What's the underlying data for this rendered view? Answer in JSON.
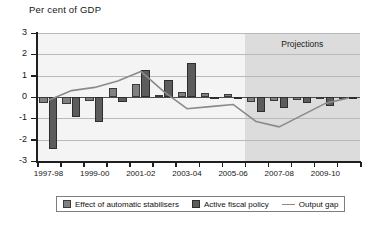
{
  "chart_data": {
    "type": "bar",
    "title": "Per cent of GDP",
    "xlabel": "",
    "ylabel": "",
    "ylim": [
      -3,
      3
    ],
    "yticks": [
      3,
      2,
      1,
      0,
      -1,
      -2,
      -3
    ],
    "grid": true,
    "legend_position": "bottom",
    "categories": [
      "1997-98",
      "1998-99",
      "1999-00",
      "2000-01",
      "2001-02",
      "2002-03",
      "2003-04",
      "2004-05",
      "2005-06",
      "2006-07",
      "2007-08",
      "2008-09",
      "2009-10",
      "2010-11"
    ],
    "xtick_labels": [
      "1997-98",
      "1999-00",
      "2001-02",
      "2003-04",
      "2005-06",
      "2007-08",
      "2009-10"
    ],
    "series": [
      {
        "name": "Effect of automatic stabilisers",
        "color": "#808080",
        "values": [
          -0.3,
          -0.35,
          -0.2,
          0.4,
          0.6,
          0.1,
          0.25,
          0.2,
          0.15,
          -0.25,
          -0.2,
          -0.15,
          -0.1,
          -0.05
        ]
      },
      {
        "name": "Active fiscal policy",
        "color": "#5c5c5c",
        "values": [
          -2.45,
          -0.95,
          -1.15,
          -0.25,
          1.25,
          0.8,
          1.6,
          -0.05,
          -0.05,
          -0.7,
          -0.5,
          -0.3,
          -0.4,
          -0.05
        ]
      }
    ],
    "line_series": {
      "name": "Output gap",
      "color": "#8a8a8a",
      "values": [
        -0.15,
        0.3,
        0.45,
        0.75,
        1.2,
        0.25,
        -0.55,
        -0.45,
        -0.35,
        -1.15,
        -1.4,
        -0.85,
        -0.3,
        -0.05
      ]
    },
    "annotation": {
      "text": "Projections",
      "starts_at_category": "2006-07"
    }
  },
  "legend": {
    "items": [
      {
        "label": "Effect of automatic stabilisers",
        "marker": "swatch-dark-bar"
      },
      {
        "label": "Active fiscal policy",
        "marker": "swatch-light-bar"
      },
      {
        "label": "Output gap",
        "marker": "line-marker"
      }
    ]
  },
  "colors": {
    "stabilisers": "#808080",
    "fiscal": "#5c5c5c",
    "output_gap": "#8a8a8a",
    "projection_shade": "#dcdcdc",
    "plot_background": "#f4f4f4"
  }
}
